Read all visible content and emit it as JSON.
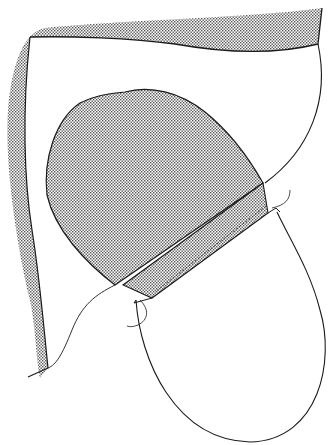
{
  "figure": {
    "type": "line-illustration",
    "width": 333,
    "height": 445,
    "colors": {
      "background": "#ffffff",
      "stroke": "#1a1a1a",
      "stipple_fill": "#9a9a9a"
    },
    "regions": [
      {
        "name": "outer-stippled-band",
        "fill": "stipple"
      },
      {
        "name": "upper-cavity",
        "fill": "none"
      },
      {
        "name": "stippled-dome",
        "fill": "stipple"
      },
      {
        "name": "stippled-cuff",
        "fill": "stipple"
      },
      {
        "name": "lower-loop",
        "fill": "none"
      },
      {
        "name": "left-thread",
        "fill": "none"
      },
      {
        "name": "right-thread",
        "fill": "none"
      }
    ]
  }
}
